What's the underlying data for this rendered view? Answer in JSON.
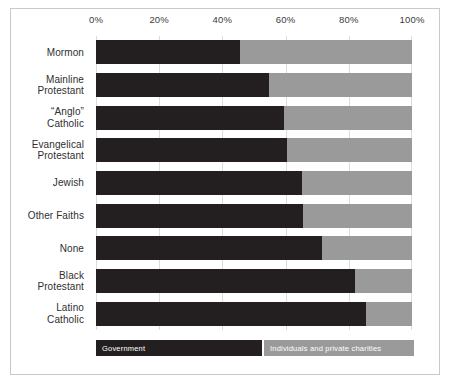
{
  "chart_data": {
    "type": "bar",
    "orientation": "horizontal",
    "stacked": true,
    "normalized": true,
    "title": "",
    "xlabel": "",
    "ylabel": "",
    "xlim": [
      0,
      100
    ],
    "grid": true,
    "legend_position": "bottom",
    "xticks": [
      {
        "value": 0,
        "label": "0%"
      },
      {
        "value": 20,
        "label": "20%"
      },
      {
        "value": 40,
        "label": "40%"
      },
      {
        "value": 60,
        "label": "60%"
      },
      {
        "value": 80,
        "label": "80%"
      },
      {
        "value": 100,
        "label": "100%"
      }
    ],
    "categories": [
      {
        "lines": [
          "Mormon"
        ]
      },
      {
        "lines": [
          "Mainline",
          "Protestant"
        ]
      },
      {
        "lines": [
          "“Anglo”",
          "Catholic"
        ]
      },
      {
        "lines": [
          "Evangelical",
          "Protestant"
        ]
      },
      {
        "lines": [
          "Jewish"
        ]
      },
      {
        "lines": [
          "Other Faiths"
        ]
      },
      {
        "lines": [
          "None"
        ]
      },
      {
        "lines": [
          "Black",
          "Protestant"
        ]
      },
      {
        "lines": [
          "Latino",
          "Catholic"
        ]
      }
    ],
    "series": [
      {
        "name": "Government",
        "color": "#231f20",
        "values": [
          45.6,
          54.7,
          59.5,
          60.4,
          65.2,
          65.5,
          71.5,
          82.0,
          85.4
        ]
      },
      {
        "name": "Individuals and private charities",
        "color": "#9a9a9a",
        "values": [
          54.4,
          45.3,
          40.5,
          39.6,
          34.8,
          34.5,
          28.5,
          18.0,
          14.6
        ]
      }
    ],
    "legend": [
      {
        "label": "Government",
        "color": "#231f20"
      },
      {
        "label": "Individuals and private charities",
        "color": "#9a9a9a"
      }
    ]
  }
}
